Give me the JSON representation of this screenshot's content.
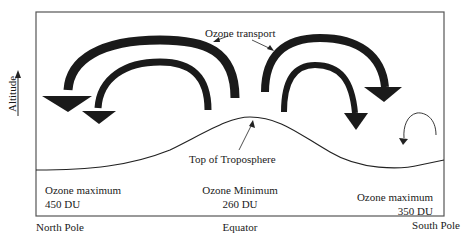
{
  "diagram": {
    "axis_label": "Altitude",
    "transport_label": "Ozone transport",
    "tropopause_label": "Top  of Troposphere",
    "regions": [
      {
        "name": "Ozone maximum",
        "value": "450 DU",
        "location": "North Pole"
      },
      {
        "name": "Ozone Minimum",
        "value": "260 DU",
        "location": "Equator"
      },
      {
        "name": "Ozone maximum",
        "value": "350 DU",
        "location": "South Pole"
      }
    ],
    "colors": {
      "arrow": "#1a1a1a",
      "frame": "#555555",
      "background": "#ffffff"
    }
  }
}
